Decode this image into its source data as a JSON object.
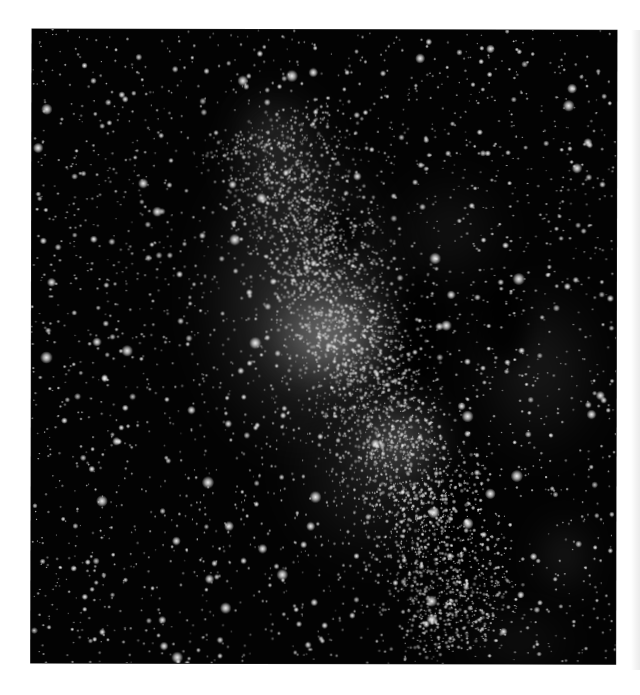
{
  "image": {
    "subject": "Milky Way galactic core star field",
    "style": "grayscale astrophotograph",
    "background_color": "#ffffff",
    "sky_color": "#030303",
    "frame": {
      "left": 32,
      "top": 29,
      "width": 585,
      "height": 634
    }
  },
  "nebula": {
    "glows": [
      {
        "name": "core-bright-cloud",
        "x": 330,
        "y": 335,
        "w": 130,
        "h": 110,
        "color": "rgba(230,230,230,0.55)"
      },
      {
        "name": "core-lower-cloud",
        "x": 400,
        "y": 440,
        "w": 90,
        "h": 80,
        "color": "rgba(210,210,210,0.45)"
      },
      {
        "name": "band-main",
        "x": 300,
        "y": 300,
        "w": 220,
        "h": 330,
        "color": "rgba(150,150,150,0.30)"
      },
      {
        "name": "band-lower",
        "x": 370,
        "y": 470,
        "w": 180,
        "h": 200,
        "color": "rgba(120,120,120,0.22)"
      },
      {
        "name": "upper-cloud",
        "x": 280,
        "y": 160,
        "w": 110,
        "h": 150,
        "color": "rgba(130,130,130,0.25)"
      },
      {
        "name": "top-wisp",
        "x": 270,
        "y": 130,
        "w": 60,
        "h": 60,
        "color": "rgba(160,160,160,0.25)"
      },
      {
        "name": "right-nebulosity",
        "x": 540,
        "y": 370,
        "w": 140,
        "h": 190,
        "color": "rgba(110,110,110,0.22)"
      },
      {
        "name": "upper-right-haze",
        "x": 450,
        "y": 230,
        "w": 120,
        "h": 120,
        "color": "rgba(100,100,100,0.18)"
      },
      {
        "name": "lower-right-cluster",
        "x": 565,
        "y": 555,
        "w": 40,
        "h": 70,
        "color": "rgba(170,170,170,0.30)"
      },
      {
        "name": "bottom-right-haze",
        "x": 520,
        "y": 640,
        "w": 120,
        "h": 60,
        "color": "rgba(100,100,100,0.18)"
      }
    ],
    "dust_lanes": [
      {
        "name": "dust-lane-center",
        "x": 420,
        "y": 330,
        "w": 40,
        "h": 110
      },
      {
        "name": "dust-lane-right",
        "x": 505,
        "y": 320,
        "w": 50,
        "h": 90
      },
      {
        "name": "dust-lane-lower",
        "x": 460,
        "y": 520,
        "w": 40,
        "h": 120
      },
      {
        "name": "dust-lane-upper",
        "x": 345,
        "y": 230,
        "w": 40,
        "h": 50
      }
    ]
  },
  "stars": {
    "seed": 20240611,
    "background_count": 2600,
    "band_count": 3200,
    "bright_count": 70,
    "band_axis": {
      "x1": 270,
      "y1": 120,
      "x2": 470,
      "y2": 640,
      "spread": 95
    }
  }
}
